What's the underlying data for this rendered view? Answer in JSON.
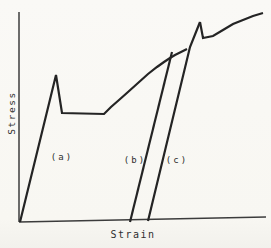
{
  "figure": {
    "background_color": "#f9f8f4",
    "curve_color": "#242424",
    "axis_color": "#3c3c3c"
  },
  "labels": {
    "y_axis": "Stress",
    "x_axis": "Strain",
    "curve_a": "(a)",
    "curve_b": "(b)",
    "curve_c": "(c)"
  },
  "chart_data": {
    "type": "line",
    "title": "",
    "xlabel": "Strain",
    "ylabel": "Stress",
    "tick_labels": "none (schematic curve, arbitrary units)",
    "grid": false,
    "legend": "none",
    "coordinate_space": "image pixels, 271x248 canvas, y increases downward",
    "curves": [
      {
        "name": "y-axis",
        "color_role": "axis_color",
        "width": 1.5,
        "points": [
          [
            19,
            12
          ],
          [
            19,
            222
          ]
        ]
      },
      {
        "name": "x-axis",
        "color_role": "axis_color",
        "width": 1.5,
        "points": [
          [
            19,
            222
          ],
          [
            266,
            217
          ]
        ]
      },
      {
        "name": "curve-a-initial-loading",
        "label": "(a)",
        "description": "elastic rise to upper yield point, drop to lower yield plateau, then work-hardening arc",
        "color_role": "curve_color",
        "width": 2.2,
        "points": [
          [
            20,
            222
          ],
          [
            56,
            75
          ],
          [
            62,
            113
          ],
          [
            104,
            114
          ],
          [
            111,
            107
          ],
          [
            119,
            100
          ],
          [
            128,
            92
          ],
          [
            138,
            83
          ],
          [
            148,
            74
          ],
          [
            157,
            67
          ],
          [
            164,
            62
          ],
          [
            170,
            58
          ],
          [
            175,
            55
          ],
          [
            181,
            52
          ],
          [
            187,
            49
          ]
        ]
      },
      {
        "name": "curve-b-unload-reload-line",
        "label": "(b)",
        "description": "immediate unload/reload line rejoining flow curve without yield point",
        "color_role": "curve_color",
        "width": 2.2,
        "points": [
          [
            130,
            222
          ],
          [
            172,
            52
          ]
        ]
      },
      {
        "name": "curve-c-reload-after-aging-line",
        "label": "(c)",
        "description": "reload after aging, overshoots to new upper yield point",
        "color_role": "curve_color",
        "width": 2.2,
        "points": [
          [
            148,
            221
          ],
          [
            190,
            47
          ],
          [
            200,
            22
          ]
        ]
      },
      {
        "name": "post-aging-flow-curve",
        "description": "drop from new upper yield, short plateau, continued work-hardening",
        "color_role": "curve_color",
        "width": 2.2,
        "points": [
          [
            200,
            22
          ],
          [
            203,
            38
          ],
          [
            213,
            36
          ],
          [
            223,
            30
          ],
          [
            233,
            24
          ],
          [
            243,
            20
          ],
          [
            253,
            16
          ],
          [
            263,
            13
          ]
        ]
      }
    ]
  }
}
